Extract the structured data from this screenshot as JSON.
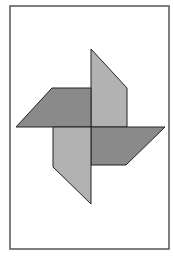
{
  "figure": {
    "width": 173,
    "height": 260,
    "background": "#ffffff",
    "frame": {
      "x": 10,
      "y": 6,
      "width": 159,
      "height": 243,
      "stroke": "#555555",
      "stroke_width": 1.5
    },
    "stroke_color": "#222222",
    "colors": {
      "dark_blade": "#8a8a8a",
      "light_blade": "#b2b2b2"
    },
    "blades": [
      {
        "name": "upper-blade",
        "shade": "light",
        "points": [
          [
            91,
            49
          ],
          [
            127,
            88
          ],
          [
            127,
            127
          ],
          [
            91,
            127
          ]
        ]
      },
      {
        "name": "left-blade",
        "shade": "dark",
        "points": [
          [
            52,
            88
          ],
          [
            91,
            88
          ],
          [
            91,
            127
          ],
          [
            16,
            127
          ]
        ]
      },
      {
        "name": "right-blade",
        "shade": "dark",
        "points": [
          [
            91,
            127
          ],
          [
            165,
            127
          ],
          [
            126,
            165
          ],
          [
            91,
            165
          ]
        ]
      },
      {
        "name": "lower-blade",
        "shade": "light",
        "points": [
          [
            53,
            127
          ],
          [
            91,
            127
          ],
          [
            91,
            204
          ],
          [
            53,
            167
          ]
        ]
      }
    ]
  }
}
